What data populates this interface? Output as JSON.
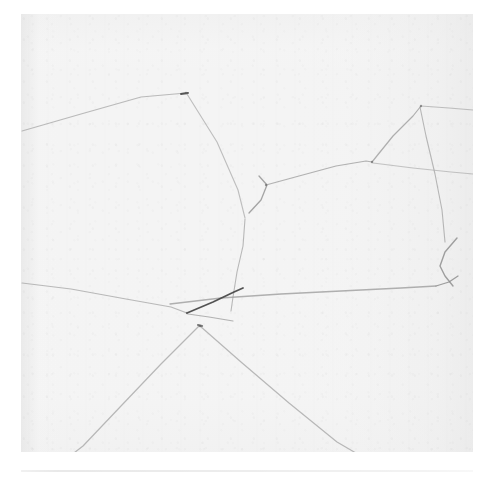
{
  "page": {
    "width": 484,
    "height": 480,
    "background_color": "#ffffff",
    "paper_color": "#f4f4f4",
    "pencil_color": "#9a9a9a",
    "dark_pencil_color": "#5a5a5a"
  },
  "scan_area": {
    "label": "Scanned paper region",
    "x": 21,
    "y": 14,
    "width": 452,
    "height": 438
  },
  "bottom_rule": {
    "label": "Faint horizontal rule below image",
    "y": 470
  },
  "chart_data": {
    "type": "line",
    "subtitle": "",
    "xlabel": "",
    "ylabel": "",
    "xlim": [
      0,
      452
    ],
    "ylim": [
      0,
      438
    ],
    "grid": false,
    "legend": "none",
    "series": [
      {
        "name": "upper-left-gable",
        "stroke": "#a5a5a5",
        "width": 1.1,
        "opacity": 0.75,
        "points": [
          [
            1,
            117
          ],
          [
            60,
            100
          ],
          [
            120,
            83
          ],
          [
            165,
            79
          ]
        ]
      },
      {
        "name": "apex-marker-upper-left",
        "stroke": "#4f4f4f",
        "width": 1.9,
        "opacity": 0.95,
        "points": [
          [
            160,
            80
          ],
          [
            167,
            79
          ]
        ]
      },
      {
        "name": "upper-left-descender",
        "stroke": "#a8a8a8",
        "width": 1.1,
        "opacity": 0.72,
        "points": [
          [
            166,
            80
          ],
          [
            196,
            128
          ],
          [
            217,
            176
          ],
          [
            224,
            204
          ]
        ]
      },
      {
        "name": "center-stem-down",
        "stroke": "#a3a3a3",
        "width": 1.1,
        "opacity": 0.75,
        "points": [
          [
            224,
            205
          ],
          [
            222,
            232
          ],
          [
            216,
            258
          ],
          [
            212,
            283
          ],
          [
            210,
            297
          ]
        ]
      },
      {
        "name": "center-tick-short",
        "stroke": "#959595",
        "width": 1.3,
        "opacity": 0.85,
        "points": [
          [
            238,
            162
          ],
          [
            246,
            171
          ],
          [
            240,
            186
          ],
          [
            228,
            199
          ]
        ]
      },
      {
        "name": "center-upper-right-ridge",
        "stroke": "#9d9d9d",
        "width": 1.2,
        "opacity": 0.78,
        "points": [
          [
            245,
            171
          ],
          [
            278,
            162
          ],
          [
            315,
            152
          ],
          [
            345,
            147
          ],
          [
            351,
            148
          ]
        ]
      },
      {
        "name": "right-node-up-branch",
        "stroke": "#9b9b9b",
        "width": 1.2,
        "opacity": 0.78,
        "points": [
          [
            351,
            148
          ],
          [
            372,
            122
          ],
          [
            392,
            102
          ],
          [
            400,
            92
          ]
        ]
      },
      {
        "name": "right-node-to-corner",
        "stroke": "#a6a6a6",
        "width": 1.1,
        "opacity": 0.7,
        "points": [
          [
            400,
            92
          ],
          [
            428,
            94
          ],
          [
            452,
            96
          ]
        ]
      },
      {
        "name": "right-node-down-right",
        "stroke": "#a0a0a0",
        "width": 1.1,
        "opacity": 0.74,
        "points": [
          [
            399,
            93
          ],
          [
            405,
            122
          ],
          [
            414,
            160
          ],
          [
            421,
            196
          ],
          [
            424,
            228
          ]
        ]
      },
      {
        "name": "right-mid-horizontal",
        "stroke": "#a9a9a9",
        "width": 1.1,
        "opacity": 0.66,
        "points": [
          [
            352,
            149
          ],
          [
            392,
            154
          ],
          [
            430,
            158
          ],
          [
            452,
            160
          ]
        ]
      },
      {
        "name": "right-hook",
        "stroke": "#8f8f8f",
        "width": 1.4,
        "opacity": 0.85,
        "points": [
          [
            436,
            224
          ],
          [
            424,
            238
          ],
          [
            419,
            252
          ],
          [
            424,
            262
          ],
          [
            432,
            272
          ]
        ]
      },
      {
        "name": "lower-horizontal-long",
        "stroke": "#9e9e9e",
        "width": 1.3,
        "opacity": 0.8,
        "points": [
          [
            149,
            290
          ],
          [
            200,
            284
          ],
          [
            260,
            280
          ],
          [
            320,
            277
          ],
          [
            380,
            274
          ],
          [
            415,
            272
          ]
        ]
      },
      {
        "name": "lower-horizontal-right-tail",
        "stroke": "#8d8d8d",
        "width": 1.3,
        "opacity": 0.85,
        "points": [
          [
            415,
            272
          ],
          [
            428,
            268
          ],
          [
            437,
            262
          ]
        ]
      },
      {
        "name": "center-left-long-diagonal",
        "stroke": "#a4a4a4",
        "width": 1.2,
        "opacity": 0.75,
        "points": [
          [
            1,
            269
          ],
          [
            50,
            275
          ],
          [
            105,
            285
          ],
          [
            150,
            293
          ],
          [
            166,
            299
          ]
        ]
      },
      {
        "name": "dark-short-segment",
        "stroke": "#4a4a4a",
        "width": 1.7,
        "opacity": 0.95,
        "points": [
          [
            166,
            299
          ],
          [
            192,
            288
          ],
          [
            213,
            278
          ],
          [
            222,
            274
          ]
        ]
      },
      {
        "name": "junction-right-stub",
        "stroke": "#a0a0a0",
        "width": 1.2,
        "opacity": 0.8,
        "points": [
          [
            167,
            300
          ],
          [
            188,
            303
          ],
          [
            206,
            306
          ],
          [
            212,
            307
          ]
        ]
      },
      {
        "name": "lower-peak-left-leg",
        "stroke": "#a2a2a2",
        "width": 1.2,
        "opacity": 0.74,
        "points": [
          [
            178,
            312
          ],
          [
            140,
            350
          ],
          [
            100,
            392
          ],
          [
            62,
            432
          ],
          [
            49,
            442
          ]
        ]
      },
      {
        "name": "lower-peak-right-leg",
        "stroke": "#a2a2a2",
        "width": 1.2,
        "opacity": 0.74,
        "points": [
          [
            179,
            312
          ],
          [
            220,
            348
          ],
          [
            268,
            389
          ],
          [
            316,
            428
          ],
          [
            340,
            442
          ]
        ]
      },
      {
        "name": "lower-peak-vertex-dot",
        "stroke": "#6a6a6a",
        "width": 2.0,
        "opacity": 0.9,
        "points": [
          [
            177,
            311
          ],
          [
            181,
            312
          ]
        ]
      }
    ],
    "vertices": [
      {
        "name": "upper-left-apex",
        "x": 165,
        "y": 79
      },
      {
        "name": "center-tick-node",
        "x": 245,
        "y": 171
      },
      {
        "name": "right-upper-node",
        "x": 400,
        "y": 92
      },
      {
        "name": "right-ridge-node",
        "x": 351,
        "y": 148
      },
      {
        "name": "dark-junction",
        "x": 166,
        "y": 299
      },
      {
        "name": "lower-peak-vertex",
        "x": 179,
        "y": 312
      }
    ]
  }
}
